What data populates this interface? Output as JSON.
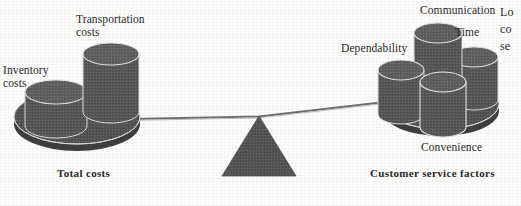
{
  "figure": {
    "type": "balance-scale-diagram",
    "title_visible": false,
    "colors": {
      "plate_fill": "#565656",
      "cylinder_fill": "#585858",
      "cylinder_top": "#5e5e5e",
      "outline": "#d8d8d8",
      "fulcrum": "#555555",
      "beam": "#6a6a6a",
      "text": "#2b2b2b",
      "background": "#fdfdfc"
    }
  },
  "left_pan": {
    "group_label": "Total costs",
    "items": [
      {
        "label": "Inventory\ncosts",
        "name": "inventory-costs"
      },
      {
        "label": "Transportation\ncosts",
        "name": "transportation-costs"
      }
    ]
  },
  "right_pan": {
    "group_label": "Customer service factors",
    "items": [
      {
        "label": "Dependability",
        "name": "dependability"
      },
      {
        "label": "Communication",
        "name": "communication"
      },
      {
        "label": "Time",
        "name": "time"
      },
      {
        "label": "Convenience",
        "name": "convenience"
      }
    ]
  },
  "edge_text": {
    "clipped": true,
    "lines": [
      "Lo",
      "co",
      "se"
    ]
  }
}
